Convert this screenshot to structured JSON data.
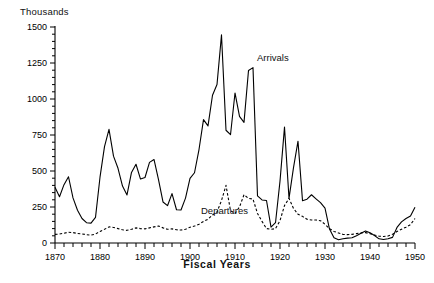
{
  "chart": {
    "unit_label": "Thousands",
    "xaxis_title": "Fiscal Years",
    "arrivals_label": "Arrivals",
    "departures_label": "Departures"
  },
  "chart_data": {
    "type": "line",
    "title": "",
    "xlabel": "Fiscal Years",
    "ylabel": "Thousands",
    "xlim": [
      1870,
      1950
    ],
    "ylim": [
      0,
      1500
    ],
    "grid": false,
    "legend_position": "inline-annotation",
    "yticks": [
      0,
      250,
      500,
      750,
      1000,
      1250,
      1500
    ],
    "ytick_labels": [
      "0",
      "250",
      "500",
      "750",
      "1000",
      "1250",
      "1500"
    ],
    "xticks": [
      1870,
      1880,
      1890,
      1900,
      1910,
      1920,
      1930,
      1940,
      1950
    ],
    "xtick_labels": [
      "1870",
      "1880",
      "1890",
      "1900",
      "1910",
      "1920",
      "1930",
      "1940",
      "1950"
    ],
    "xminor_step": 2,
    "annotations": [
      {
        "text": "Arrivals",
        "x": 1911,
        "y": 1180
      },
      {
        "text": "Departures",
        "x": 1902,
        "y": 110
      }
    ],
    "series": [
      {
        "name": "Arrivals",
        "style": "solid",
        "color": "#000000",
        "x": [
          1870,
          1871,
          1872,
          1873,
          1874,
          1875,
          1876,
          1877,
          1878,
          1879,
          1880,
          1881,
          1882,
          1883,
          1884,
          1885,
          1886,
          1887,
          1888,
          1889,
          1890,
          1891,
          1892,
          1893,
          1894,
          1895,
          1896,
          1897,
          1898,
          1899,
          1900,
          1901,
          1902,
          1903,
          1904,
          1905,
          1906,
          1907,
          1908,
          1909,
          1910,
          1911,
          1912,
          1913,
          1914,
          1915,
          1916,
          1917,
          1918,
          1919,
          1920,
          1921,
          1922,
          1923,
          1924,
          1925,
          1926,
          1927,
          1928,
          1929,
          1930,
          1931,
          1932,
          1933,
          1934,
          1935,
          1936,
          1937,
          1938,
          1939,
          1940,
          1941,
          1942,
          1943,
          1944,
          1945,
          1946,
          1947,
          1948,
          1949,
          1950
        ],
        "values": [
          387,
          321,
          405,
          460,
          313,
          227,
          170,
          141,
          138,
          178,
          457,
          669,
          789,
          603,
          519,
          395,
          334,
          490,
          547,
          444,
          455,
          560,
          580,
          440,
          285,
          259,
          343,
          231,
          229,
          312,
          449,
          488,
          649,
          857,
          813,
          1026,
          1101,
          1445,
          783,
          752,
          1042,
          879,
          838,
          1198,
          1218,
          327,
          299,
          295,
          110,
          141,
          430,
          805,
          310,
          523,
          707,
          294,
          304,
          335,
          307,
          280,
          242,
          97,
          36,
          23,
          29,
          34,
          36,
          50,
          67,
          83,
          71,
          52,
          29,
          24,
          29,
          39,
          108,
          147,
          170,
          188,
          249
        ],
        "last_value_hint": 249
      },
      {
        "name": "Departures",
        "style": "dashed",
        "color": "#000000",
        "x": [
          1870,
          1871,
          1872,
          1873,
          1874,
          1875,
          1876,
          1877,
          1878,
          1879,
          1880,
          1881,
          1882,
          1883,
          1884,
          1885,
          1886,
          1887,
          1888,
          1889,
          1890,
          1891,
          1892,
          1893,
          1894,
          1895,
          1896,
          1897,
          1898,
          1899,
          1900,
          1901,
          1902,
          1903,
          1904,
          1905,
          1906,
          1907,
          1908,
          1909,
          1910,
          1911,
          1912,
          1913,
          1914,
          1915,
          1916,
          1917,
          1918,
          1919,
          1920,
          1921,
          1922,
          1923,
          1924,
          1925,
          1926,
          1927,
          1928,
          1929,
          1930,
          1931,
          1932,
          1933,
          1934,
          1935,
          1936,
          1937,
          1938,
          1939,
          1940,
          1941,
          1942,
          1943,
          1944,
          1945,
          1946,
          1947,
          1948,
          1949,
          1950
        ],
        "values": [
          60,
          62,
          68,
          75,
          72,
          66,
          63,
          58,
          55,
          62,
          80,
          95,
          112,
          108,
          100,
          92,
          88,
          95,
          105,
          100,
          98,
          105,
          112,
          118,
          105,
          95,
          98,
          92,
          90,
          95,
          110,
          118,
          130,
          150,
          165,
          195,
          215,
          295,
          400,
          225,
          205,
          250,
          335,
          310,
          305,
          205,
          150,
          100,
          95,
          100,
          155,
          260,
          310,
          240,
          200,
          185,
          165,
          160,
          160,
          155,
          130,
          100,
          80,
          70,
          60,
          58,
          60,
          65,
          70,
          72,
          65,
          55,
          48,
          45,
          48,
          60,
          80,
          95,
          110,
          128,
          170
        ]
      }
    ]
  }
}
